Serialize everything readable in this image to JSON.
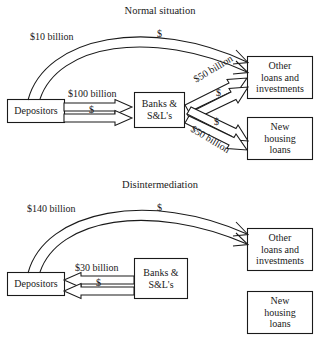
{
  "figure": {
    "type": "flow-diagram",
    "background_color": "#ffffff",
    "line_color": "#1a1a1a"
  },
  "panels": [
    {
      "id": "normal",
      "title": "Normal situation",
      "boxes": [
        {
          "id": "depositors",
          "label": "Depositors"
        },
        {
          "id": "banks",
          "label_line1": "Banks &",
          "label_line2": "S&L's"
        },
        {
          "id": "other-loans",
          "label_line1": "Other",
          "label_line2": "loans and",
          "label_line3": "investments"
        },
        {
          "id": "new-housing",
          "label_line1": "New",
          "label_line2": "housing",
          "label_line3": "loans"
        }
      ],
      "flows": [
        {
          "id": "depositors-to-other-direct",
          "amount": "$10 billion",
          "marker": "$",
          "from": "depositors",
          "to": "other-loans",
          "shape": "arc"
        },
        {
          "id": "depositors-to-banks",
          "amount": "$100 billion",
          "marker": "$",
          "from": "depositors",
          "to": "banks",
          "shape": "straight"
        },
        {
          "id": "banks-to-other",
          "amount": "$50 billion",
          "marker": "$",
          "from": "banks",
          "to": "other-loans",
          "shape": "diagonal-up"
        },
        {
          "id": "banks-to-housing",
          "amount": "$50 billion",
          "marker": "$",
          "from": "banks",
          "to": "new-housing",
          "shape": "diagonal-down"
        }
      ]
    },
    {
      "id": "disintermediation",
      "title": "Disintermediation",
      "boxes": [
        {
          "id": "depositors",
          "label": "Depositors"
        },
        {
          "id": "banks",
          "label_line1": "Banks &",
          "label_line2": "S&L's"
        },
        {
          "id": "other-loans",
          "label_line1": "Other",
          "label_line2": "loans and",
          "label_line3": "investments"
        },
        {
          "id": "new-housing",
          "label_line1": "New",
          "label_line2": "housing",
          "label_line3": "loans"
        }
      ],
      "flows": [
        {
          "id": "depositors-to-other-direct",
          "amount": "$140 billion",
          "marker": "$",
          "from": "depositors",
          "to": "other-loans",
          "shape": "arc"
        },
        {
          "id": "banks-to-depositors",
          "amount": "$30 billion",
          "marker": "$",
          "from": "banks",
          "to": "depositors",
          "shape": "straight-reverse"
        }
      ]
    }
  ]
}
